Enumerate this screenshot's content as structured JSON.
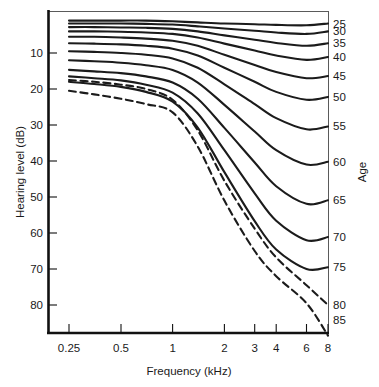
{
  "chart_data": {
    "type": "line",
    "title": "",
    "xlabel": "Frequency (kHz)",
    "ylabel": "Hearing level (dB)",
    "xscale": "log",
    "xlim": [
      0.25,
      8
    ],
    "ylim": [
      -2,
      88
    ],
    "y_inverted": true,
    "grid": false,
    "legend_position": "right-axis",
    "legend_title": "Age",
    "xticks": [
      "0.25",
      "0.5",
      "1",
      "2",
      "3",
      "4",
      "6",
      "8"
    ],
    "xtick_values": [
      0.25,
      0.5,
      1,
      2,
      3,
      4,
      6,
      8
    ],
    "yticks": [
      "10",
      "20",
      "30",
      "40",
      "50",
      "60",
      "70",
      "80"
    ],
    "ytick_values": [
      10,
      20,
      30,
      40,
      50,
      60,
      70,
      80
    ],
    "x": [
      0.25,
      0.35,
      0.5,
      0.7,
      1,
      1.4,
      2,
      3,
      4,
      6,
      8
    ],
    "series": [
      {
        "name": "25",
        "label": "25",
        "style": "solid",
        "values": [
          1.0,
          1.0,
          1.0,
          1.0,
          1.2,
          1.5,
          1.8,
          2.0,
          2.2,
          2.3,
          1.8
        ]
      },
      {
        "name": "30",
        "label": "30",
        "style": "solid",
        "values": [
          1.8,
          1.8,
          1.8,
          1.9,
          2.1,
          2.6,
          3.2,
          3.8,
          4.3,
          4.7,
          4.0
        ]
      },
      {
        "name": "35",
        "label": "35",
        "style": "solid",
        "values": [
          2.8,
          2.8,
          2.9,
          3.0,
          3.3,
          4.0,
          5.1,
          6.3,
          7.2,
          8.0,
          7.3
        ]
      },
      {
        "name": "40",
        "label": "40",
        "style": "solid",
        "values": [
          4.0,
          4.0,
          4.1,
          4.3,
          4.7,
          5.7,
          7.4,
          9.3,
          10.7,
          11.9,
          11.1
        ]
      },
      {
        "name": "45",
        "label": "45",
        "style": "solid",
        "values": [
          5.5,
          5.5,
          5.7,
          6.0,
          6.6,
          8.0,
          10.5,
          13.3,
          15.3,
          17.0,
          16.4
        ]
      },
      {
        "name": "50",
        "label": "50",
        "style": "solid",
        "values": [
          7.3,
          7.4,
          7.6,
          8.0,
          8.8,
          10.7,
          14.1,
          18.0,
          20.8,
          23.0,
          22.2
        ]
      },
      {
        "name": "55",
        "label": "55",
        "style": "solid",
        "values": [
          9.5,
          9.7,
          10.0,
          10.5,
          11.5,
          14.1,
          18.7,
          24.2,
          28.1,
          31.2,
          30.4
        ]
      },
      {
        "name": "60",
        "label": "60",
        "style": "solid",
        "values": [
          12.0,
          12.3,
          12.7,
          13.4,
          14.7,
          18.2,
          24.4,
          31.8,
          37.0,
          41.0,
          40.2
        ]
      },
      {
        "name": "65",
        "label": "65",
        "style": "solid",
        "values": [
          14.7,
          15.1,
          15.6,
          16.5,
          18.2,
          22.7,
          30.8,
          40.4,
          47.0,
          51.9,
          50.9
        ]
      },
      {
        "name": "70",
        "label": "70",
        "style": "solid",
        "values": [
          16.5,
          17.0,
          17.6,
          18.8,
          21.0,
          26.8,
          37.0,
          49.0,
          56.6,
          62.0,
          61.1
        ]
      },
      {
        "name": "75",
        "label": "75",
        "style": "solid",
        "values": [
          18.0,
          18.6,
          19.4,
          20.8,
          23.5,
          30.7,
          43.1,
          56.7,
          64.6,
          70.0,
          69.5
        ]
      },
      {
        "name": "80",
        "label": "80",
        "style": "dashed",
        "values": [
          17.5,
          18.0,
          18.8,
          20.0,
          23.0,
          31.5,
          45.5,
          58.8,
          66.8,
          74.5,
          80.0
        ]
      },
      {
        "name": "85",
        "label": "85",
        "style": "dashed",
        "values": [
          20.5,
          21.5,
          22.7,
          24.2,
          26.5,
          36.0,
          51.0,
          65.0,
          72.0,
          79.5,
          88.5
        ]
      }
    ]
  },
  "axis_titles": {
    "y": "Hearing level (dB)",
    "x": "Frequency (kHz)",
    "right": "Age"
  }
}
